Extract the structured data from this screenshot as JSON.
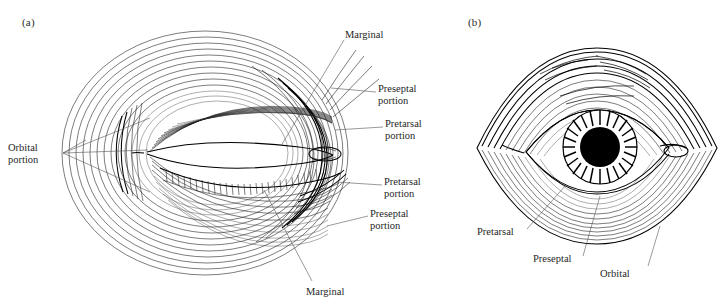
{
  "figure": {
    "background_color": "#ffffff",
    "ink_color": "#111111",
    "leader_color": "#555555",
    "panels": [
      {
        "tag": "(a)",
        "view": "dissected-muscle-fiber-diagram",
        "labels": [
          {
            "key": "orbital_left",
            "text": "Orbital\nportion",
            "x": 8,
            "y": 142,
            "align": "left"
          },
          {
            "key": "marginal_top",
            "text": "Marginal",
            "x": 345,
            "y": 29,
            "align": "left"
          },
          {
            "key": "preseptal_top",
            "text": "Preseptal\nportion",
            "x": 378,
            "y": 83,
            "align": "left"
          },
          {
            "key": "pretarsal_top",
            "text": "Pretarsal\nportion",
            "x": 385,
            "y": 118,
            "align": "left"
          },
          {
            "key": "pretarsal_bot",
            "text": "Pretarsal\nportion",
            "x": 384,
            "y": 176,
            "align": "left"
          },
          {
            "key": "preseptal_bot",
            "text": "Preseptal\nportion",
            "x": 370,
            "y": 208,
            "align": "left"
          },
          {
            "key": "marginal_bot",
            "text": "Marginal",
            "x": 306,
            "y": 286,
            "align": "left"
          }
        ]
      },
      {
        "tag": "(b)",
        "view": "surface-eye-with-muscle-bands",
        "labels": [
          {
            "key": "pretarsal",
            "text": "Pretarsal",
            "x": 477,
            "y": 226,
            "align": "left"
          },
          {
            "key": "preseptal",
            "text": "Preseptal",
            "x": 533,
            "y": 253,
            "align": "left"
          },
          {
            "key": "orbital",
            "text": "Orbital",
            "x": 600,
            "y": 268,
            "align": "left"
          }
        ]
      }
    ]
  }
}
